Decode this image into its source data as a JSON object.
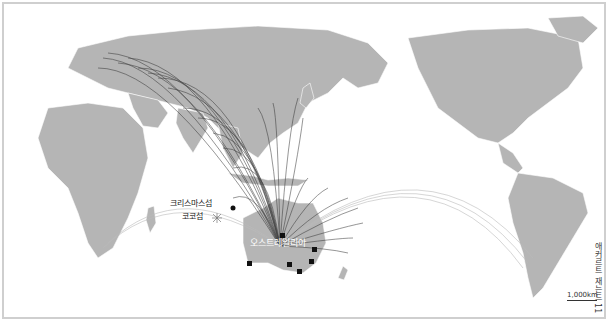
{
  "map": {
    "title_vertical": "애커르트 재는드 11",
    "colors": {
      "land": "#b5b5b5",
      "ocean": "#ffffff",
      "border": "#ffffff",
      "flow_line": "#333333",
      "flow_line_light": "#bbbbbb",
      "frame": "#cfcfcf"
    },
    "labels": {
      "christmas_island": "크리스마스섬",
      "cocos_island": "코코섬",
      "australia": "오스트레일리아"
    },
    "scale": {
      "label": "1,000km"
    },
    "markers": [
      {
        "name": "perth",
        "x": 243,
        "y": 257
      },
      {
        "name": "darwin",
        "x": 276,
        "y": 229
      },
      {
        "name": "adelaide",
        "x": 283,
        "y": 258
      },
      {
        "name": "melbourne",
        "x": 293,
        "y": 265
      },
      {
        "name": "sydney",
        "x": 305,
        "y": 255
      },
      {
        "name": "brisbane",
        "x": 308,
        "y": 243
      }
    ]
  }
}
